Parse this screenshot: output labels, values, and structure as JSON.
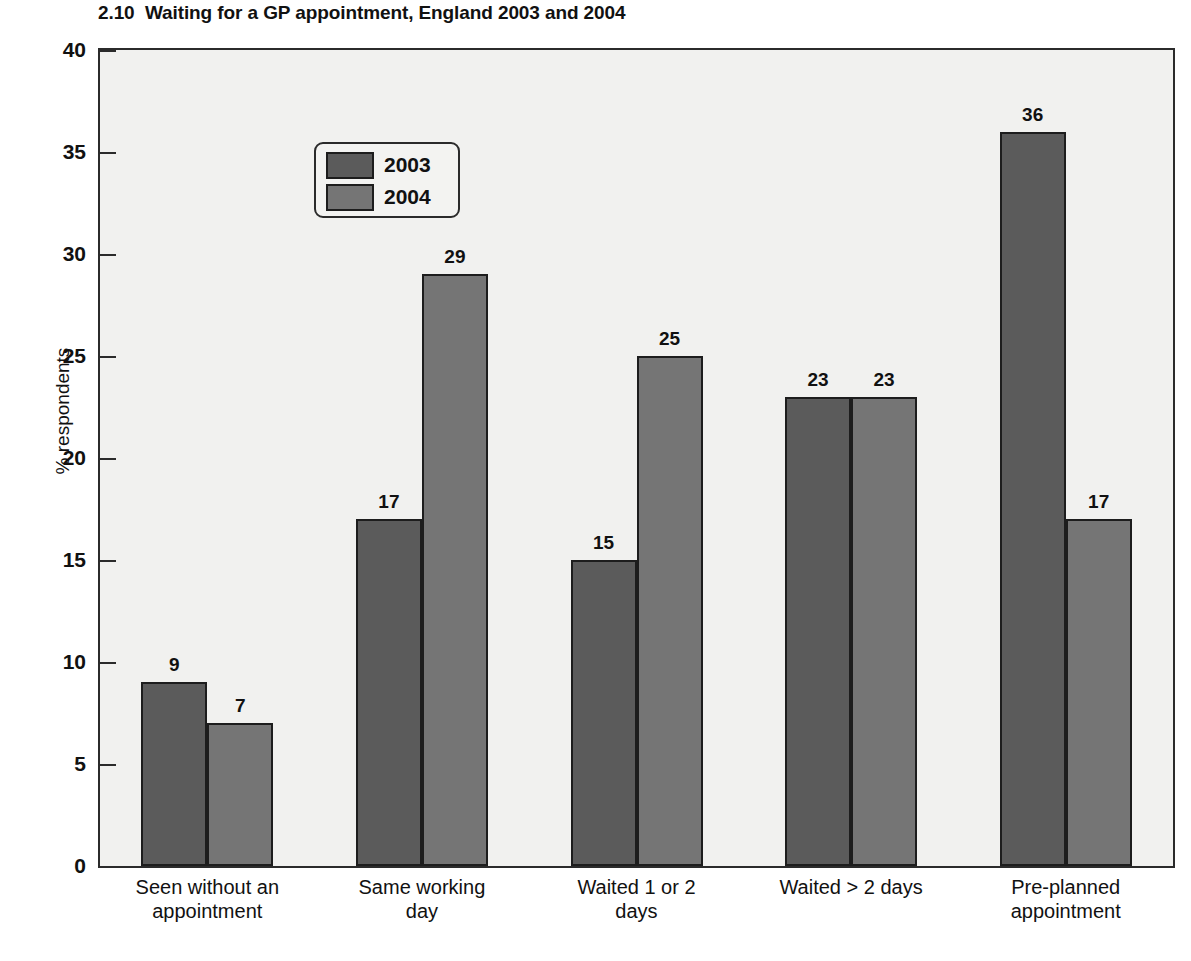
{
  "chart_data": {
    "type": "bar",
    "title": "2.10  Waiting for a GP appointment, England 2003 and 2004",
    "xlabel": "",
    "ylabel": "% respondents",
    "ylim": [
      0,
      40
    ],
    "ytick_step": 5,
    "ytick_labels": [
      "0",
      "5",
      "10",
      "15",
      "20",
      "25",
      "30",
      "35",
      "40"
    ],
    "grid": false,
    "legend_position": "upper-left-inside",
    "categories": [
      "Seen without an\nappointment",
      "Same working\nday",
      "Waited 1 or 2\ndays",
      "Waited > 2 days",
      "Pre-planned\nappointment"
    ],
    "series": [
      {
        "name": "2003",
        "color": "#5b5b5b",
        "values": [
          9,
          17,
          15,
          23,
          36
        ],
        "value_labels": [
          "9",
          "17",
          "15",
          "23",
          "36"
        ]
      },
      {
        "name": "2004",
        "color": "#757575",
        "values": [
          7,
          29,
          25,
          23,
          17
        ],
        "value_labels": [
          "7",
          "29",
          "25",
          "23",
          "17"
        ]
      }
    ]
  },
  "legend": {
    "items": [
      {
        "label": "2003",
        "color": "#5b5b5b"
      },
      {
        "label": "2004",
        "color": "#757575"
      }
    ]
  },
  "colors": {
    "plot_background": "#f1f1ef",
    "axis": "#2b2b2b",
    "text": "#111111",
    "series_2003": "#5b5b5b",
    "series_2004": "#757575"
  }
}
